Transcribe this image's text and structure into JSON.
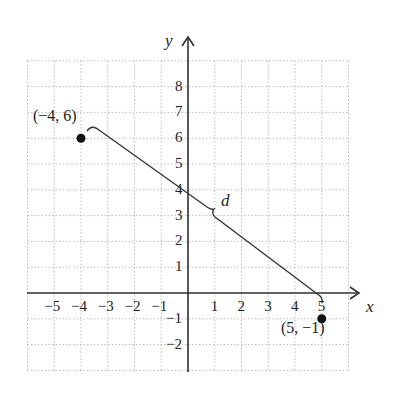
{
  "chart_data": {
    "type": "scatter",
    "title": "",
    "xlabel": "x",
    "ylabel": "y",
    "xlim": [
      -6,
      6
    ],
    "ylim": [
      -3,
      9
    ],
    "grid": true,
    "x_ticks": [
      "−5",
      "−4",
      "−3",
      "−2",
      "−1",
      "1",
      "2",
      "3",
      "4",
      "5"
    ],
    "y_ticks": [
      "8",
      "7",
      "6",
      "5",
      "4",
      "3",
      "2",
      "1",
      "−1",
      "−2"
    ],
    "points": [
      {
        "x": -4,
        "y": 6,
        "label": "(−4, 6)"
      },
      {
        "x": 5,
        "y": -1,
        "label": "(5, −1)"
      }
    ],
    "annotations": [
      {
        "type": "brace",
        "from": [
          -4,
          6
        ],
        "to": [
          5,
          -1
        ],
        "label": "d"
      }
    ]
  },
  "labels": {
    "x_axis": "x",
    "y_axis": "y",
    "distance": "d",
    "point_a": "(−4, 6)",
    "point_b": "(5, −1)"
  }
}
